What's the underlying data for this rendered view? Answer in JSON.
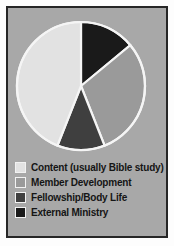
{
  "chart_data": {
    "type": "pie",
    "title": "",
    "categories": [
      "Content (usually Bible study)",
      "Member Development",
      "Fellowship/Body Life",
      "External Ministry"
    ],
    "values": [
      44,
      30,
      12,
      14
    ],
    "units": "percent",
    "start_angle_deg": 0,
    "direction": "clockwise",
    "colors": [
      "#e2e2e2",
      "#9a9a9a",
      "#3f3f3f",
      "#1a1a1a"
    ],
    "slice_edge_color": "#f5f5f5",
    "legend_position": "bottom-left",
    "grid": false,
    "slices": [
      {
        "label": "Content (usually Bible study)",
        "value": 44,
        "color": "#e2e2e2",
        "start_deg": 202,
        "end_deg": 360
      },
      {
        "label": "Member Development",
        "value": 30,
        "color": "#9a9a9a",
        "start_deg": 51,
        "end_deg": 160
      },
      {
        "label": "Fellowship/Body Life",
        "value": 12,
        "color": "#3f3f3f",
        "start_deg": 160,
        "end_deg": 202
      },
      {
        "label": "External Ministry",
        "value": 14,
        "color": "#1a1a1a",
        "start_deg": 0,
        "end_deg": 51
      }
    ]
  },
  "legend": {
    "items": [
      {
        "label": "Content (usually Bible study)",
        "color": "#e2e2e2"
      },
      {
        "label": "Member Development",
        "color": "#9a9a9a"
      },
      {
        "label": "Fellowship/Body Life",
        "color": "#3f3f3f"
      },
      {
        "label": "External Ministry",
        "color": "#1a1a1a"
      }
    ]
  },
  "style": {
    "background": "#a8a8a8",
    "frame_border": "#262626",
    "page_background": "#fdfdfd"
  }
}
